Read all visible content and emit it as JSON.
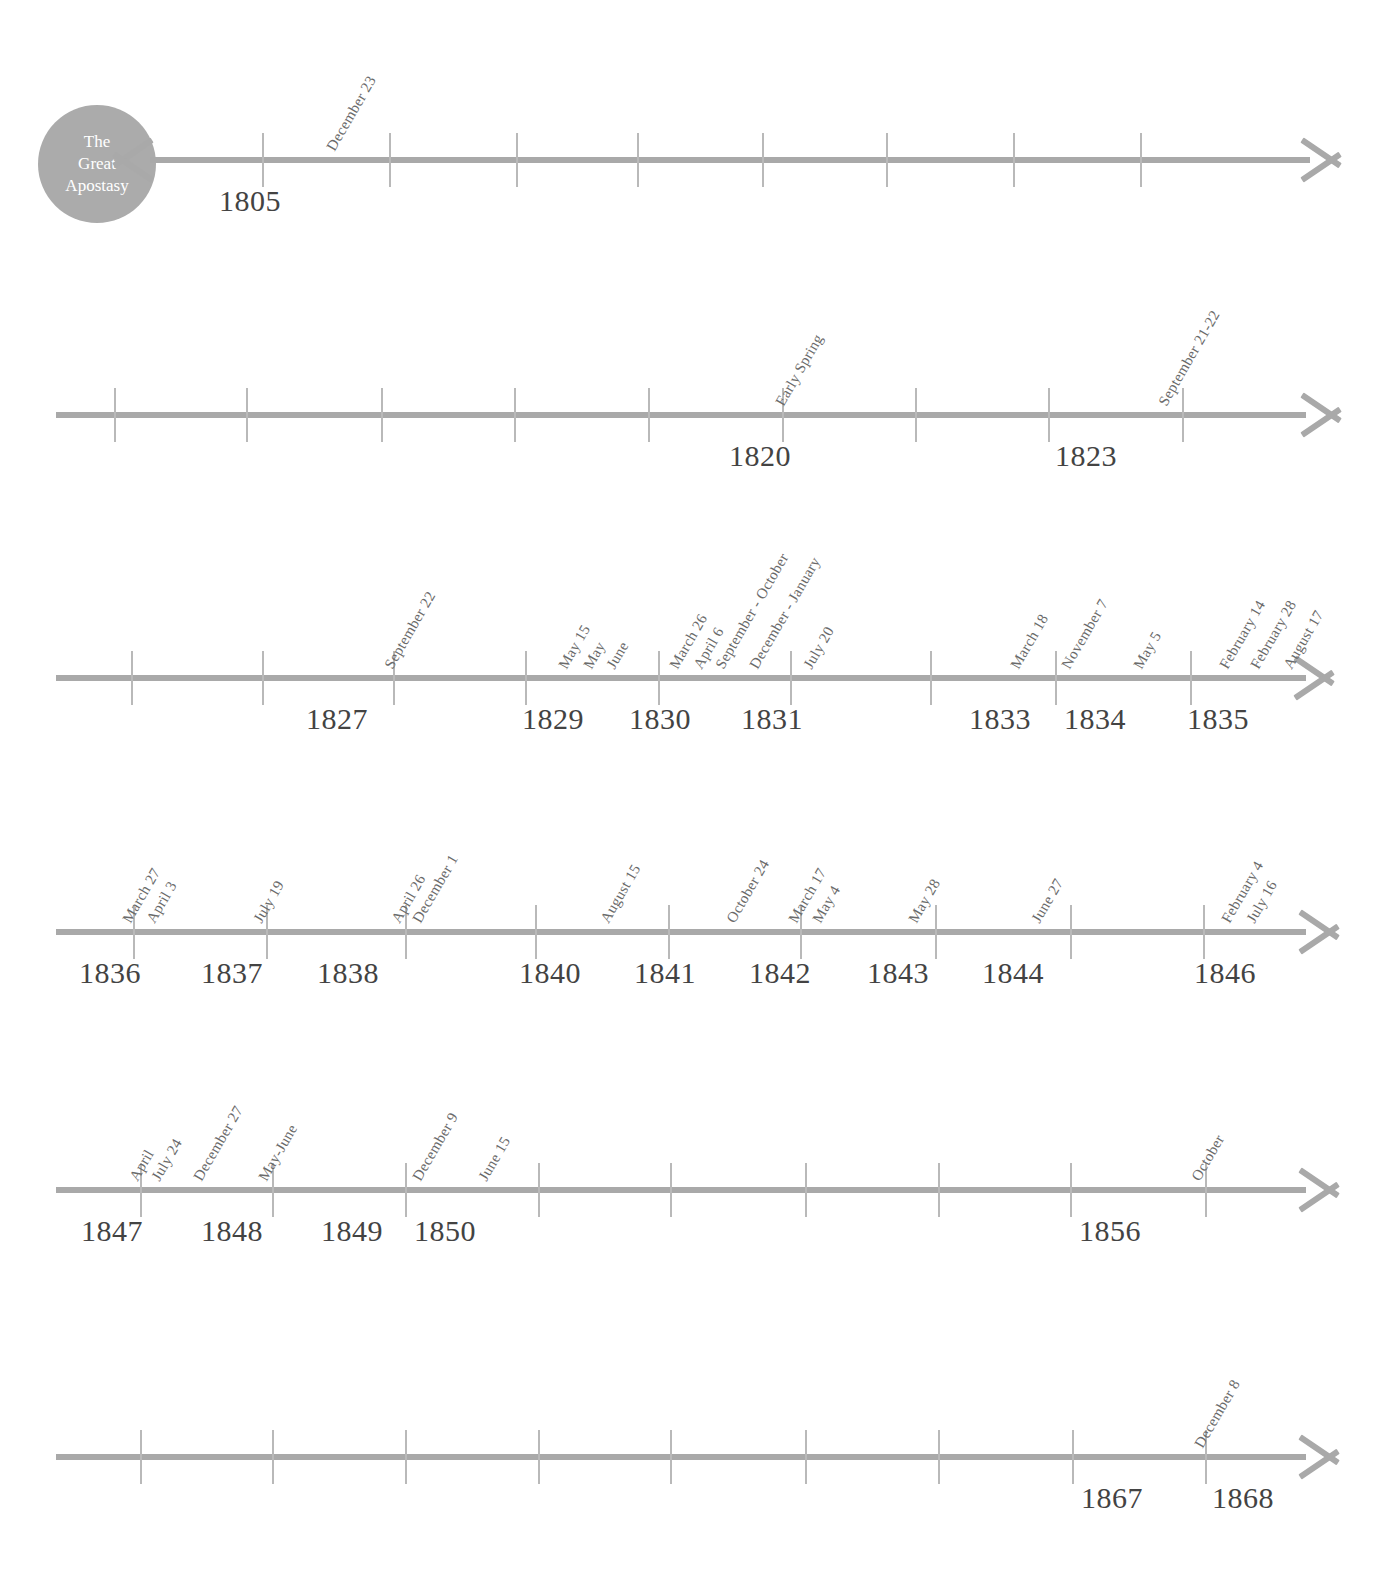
{
  "document": {
    "title": "The Great Apostasy Timeline",
    "colors": {
      "axis": "#a9a9a9",
      "tick": "#b9b9b9",
      "year_text": "#434343",
      "event_text": "#6a6a6a",
      "badge_fill": "#ababab",
      "badge_text": "#ffffff",
      "background": "#ffffff"
    }
  },
  "origin_badge": {
    "name": "the-great-apostasy-badge",
    "line1": "The",
    "line2": "Great",
    "line3": "Apostasy"
  },
  "rows": [
    {
      "id": "row-1",
      "y": 160,
      "bar": {
        "left": 150,
        "width": 1160
      },
      "arrow_left": {
        "x": 152
      },
      "arrow_right": {
        "x": 1302
      },
      "ticks": [
        262,
        389,
        516,
        637,
        762,
        886,
        1013,
        1140
      ],
      "years": [
        {
          "label": "1805",
          "x": 250
        }
      ],
      "events": [
        {
          "label": "December 23",
          "x": 338
        }
      ]
    },
    {
      "id": "row-2",
      "y": 415,
      "bar": {
        "left": 56,
        "width": 1250
      },
      "arrow_right": {
        "x": 1302
      },
      "ticks": [
        114,
        246,
        381,
        514,
        648,
        782,
        915,
        1048,
        1182
      ],
      "years": [
        {
          "label": "1820",
          "x": 760
        },
        {
          "label": "1823",
          "x": 1086
        }
      ],
      "events": [
        {
          "label": "Early Spring",
          "x": 787
        },
        {
          "label": "September 21-22",
          "x": 1170
        }
      ]
    },
    {
      "id": "row-3",
      "y": 678,
      "bar": {
        "left": 56,
        "width": 1250
      },
      "arrow_right": {
        "x": 1295
      },
      "ticks": [
        131,
        262,
        393,
        525,
        658,
        790,
        930,
        1055,
        1190
      ],
      "years": [
        {
          "label": "1827",
          "x": 337
        },
        {
          "label": "1829",
          "x": 553
        },
        {
          "label": "1830",
          "x": 660
        },
        {
          "label": "1831",
          "x": 772
        },
        {
          "label": "1833",
          "x": 1000
        },
        {
          "label": "1834",
          "x": 1095
        },
        {
          "label": "1835",
          "x": 1218
        }
      ],
      "events": [
        {
          "label": "September 22",
          "x": 396
        },
        {
          "label": "May 15",
          "x": 570
        },
        {
          "label": "May",
          "x": 595
        },
        {
          "label": "June",
          "x": 618
        },
        {
          "label": "March 26",
          "x": 681
        },
        {
          "label": "April 6",
          "x": 705
        },
        {
          "label": "September - October",
          "x": 727
        },
        {
          "label": "December - January",
          "x": 761
        },
        {
          "label": "July 20",
          "x": 815
        },
        {
          "label": "March 18",
          "x": 1022
        },
        {
          "label": "November 7",
          "x": 1073
        },
        {
          "label": "May 5",
          "x": 1145
        },
        {
          "label": "February 14",
          "x": 1231
        },
        {
          "label": "February 28",
          "x": 1262
        },
        {
          "label": "August 17",
          "x": 1295
        }
      ]
    },
    {
      "id": "row-4",
      "y": 932,
      "bar": {
        "left": 56,
        "width": 1250
      },
      "arrow_right": {
        "x": 1300
      },
      "ticks": [
        133,
        266,
        405,
        535,
        668,
        800,
        935,
        1070,
        1203
      ],
      "years": [
        {
          "label": "1836",
          "x": 110
        },
        {
          "label": "1837",
          "x": 232
        },
        {
          "label": "1838",
          "x": 348
        },
        {
          "label": "1840",
          "x": 550
        },
        {
          "label": "1841",
          "x": 665
        },
        {
          "label": "1842",
          "x": 780
        },
        {
          "label": "1843",
          "x": 898
        },
        {
          "label": "1844",
          "x": 1013
        },
        {
          "label": "1846",
          "x": 1225
        }
      ],
      "events": [
        {
          "label": "March 27",
          "x": 134
        },
        {
          "label": "April 3",
          "x": 158
        },
        {
          "label": "July 19",
          "x": 265
        },
        {
          "label": "April 26",
          "x": 403
        },
        {
          "label": "December 1",
          "x": 424
        },
        {
          "label": "August 15",
          "x": 612
        },
        {
          "label": "October 24",
          "x": 738
        },
        {
          "label": "March 17",
          "x": 800
        },
        {
          "label": "May 4",
          "x": 824
        },
        {
          "label": "May 28",
          "x": 920
        },
        {
          "label": "June 27",
          "x": 1043
        },
        {
          "label": "February 4",
          "x": 1233
        },
        {
          "label": "July 16",
          "x": 1258
        }
      ]
    },
    {
      "id": "row-5",
      "y": 1190,
      "bar": {
        "left": 56,
        "width": 1250
      },
      "arrow_right": {
        "x": 1300
      },
      "ticks": [
        140,
        272,
        405,
        538,
        670,
        805,
        938,
        1070,
        1205
      ],
      "years": [
        {
          "label": "1847",
          "x": 112
        },
        {
          "label": "1848",
          "x": 232
        },
        {
          "label": "1849",
          "x": 352
        },
        {
          "label": "1850",
          "x": 445
        },
        {
          "label": "1856",
          "x": 1110
        }
      ],
      "events": [
        {
          "label": "April",
          "x": 141
        },
        {
          "label": "July 24",
          "x": 163
        },
        {
          "label": "December 27",
          "x": 205
        },
        {
          "label": "May-June",
          "x": 270
        },
        {
          "label": "December 9",
          "x": 424
        },
        {
          "label": "June 15",
          "x": 490
        },
        {
          "label": "October",
          "x": 1203
        }
      ]
    },
    {
      "id": "row-6",
      "y": 1457,
      "bar": {
        "left": 56,
        "width": 1250
      },
      "arrow_right": {
        "x": 1300
      },
      "ticks": [
        140,
        272,
        405,
        538,
        670,
        805,
        938,
        1072,
        1205
      ],
      "years": [
        {
          "label": "1867",
          "x": 1112
        },
        {
          "label": "1868",
          "x": 1243
        }
      ],
      "events": [
        {
          "label": "December 8",
          "x": 1206
        }
      ]
    }
  ]
}
